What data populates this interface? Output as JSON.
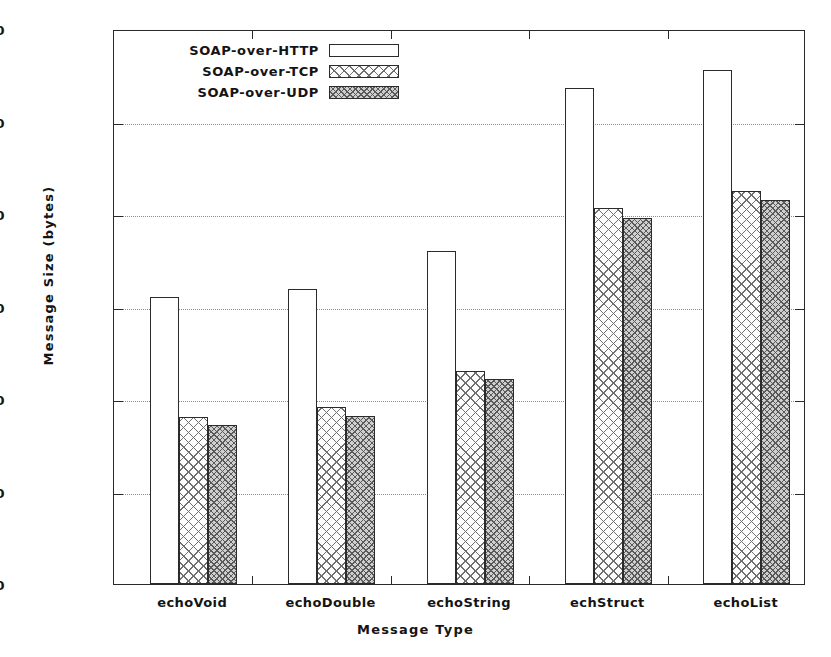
{
  "chart_data": {
    "type": "bar",
    "title": "",
    "xlabel": "Message Type",
    "ylabel": "Message Size (bytes)",
    "categories": [
      "echoVoid",
      "echoDouble",
      "echoString",
      "echStruct",
      "echoList"
    ],
    "series": [
      {
        "name": "SOAP-over-HTTP",
        "pattern": "empty",
        "values": [
          620,
          638,
          720,
          1072,
          1112
        ]
      },
      {
        "name": "SOAP-over-TCP",
        "pattern": "crosshatch",
        "values": [
          362,
          382,
          460,
          812,
          850
        ]
      },
      {
        "name": "SOAP-over-UDP",
        "pattern": "dense-hatch",
        "values": [
          343,
          363,
          444,
          791,
          830
        ]
      }
    ],
    "ylim": [
      0,
      1200
    ],
    "yticks": [
      0,
      200,
      400,
      600,
      800,
      1000,
      1200
    ],
    "ytick_labels": [
      "0",
      "200",
      "400",
      "600",
      "800",
      "1000",
      "1200"
    ],
    "grid": true,
    "grid_style": "dotted-horizontal",
    "legend_position": "top-left-inside",
    "legend": [
      {
        "label": "SOAP-over-HTTP",
        "swatch": "empty"
      },
      {
        "label": "SOAP-over-TCP",
        "swatch": "crosshatch"
      },
      {
        "label": "SOAP-over-UDP",
        "swatch": "dense-hatch"
      }
    ],
    "colors": {
      "axis": "#2a2a2a",
      "grid": "#8d8d8d",
      "text": "#141414",
      "background": "#ffffff",
      "bar_outline": "#2b2b2b",
      "http_fill": "#ffffff",
      "tcp_fill": "#fdfdfd",
      "udp_fill": "#cfcfcf"
    }
  }
}
